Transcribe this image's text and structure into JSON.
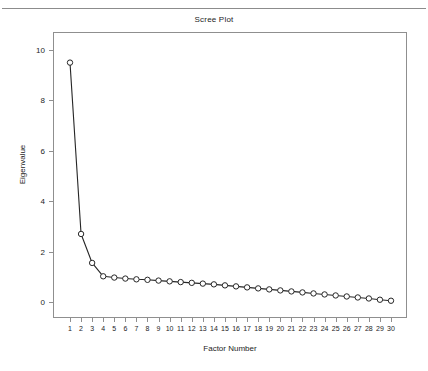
{
  "chart_data": {
    "type": "line",
    "title": "Scree Plot",
    "xlabel": "Factor Number",
    "ylabel": "Eigenvalue",
    "x": [
      1,
      2,
      3,
      4,
      5,
      6,
      7,
      8,
      9,
      10,
      11,
      12,
      13,
      14,
      15,
      16,
      17,
      18,
      19,
      20,
      21,
      22,
      23,
      24,
      25,
      26,
      27,
      28,
      29,
      30
    ],
    "values": [
      9.5,
      2.7,
      1.55,
      1.02,
      0.97,
      0.93,
      0.9,
      0.88,
      0.85,
      0.82,
      0.79,
      0.76,
      0.73,
      0.7,
      0.66,
      0.62,
      0.58,
      0.54,
      0.5,
      0.46,
      0.42,
      0.38,
      0.34,
      0.3,
      0.26,
      0.22,
      0.18,
      0.14,
      0.09,
      0.05
    ],
    "series": [
      {
        "name": "Eigenvalue",
        "values": [
          9.5,
          2.7,
          1.55,
          1.02,
          0.97,
          0.93,
          0.9,
          0.88,
          0.85,
          0.82,
          0.79,
          0.76,
          0.73,
          0.7,
          0.66,
          0.62,
          0.58,
          0.54,
          0.5,
          0.46,
          0.42,
          0.38,
          0.34,
          0.3,
          0.26,
          0.22,
          0.18,
          0.14,
          0.09,
          0.05
        ]
      }
    ],
    "xlim": [
      0.5,
      30.5
    ],
    "ylim": [
      0,
      10.5
    ],
    "yticks": [
      0,
      2,
      4,
      6,
      8,
      10
    ],
    "ytick_labels": [
      "0",
      "2",
      "4",
      "6",
      "8",
      "10"
    ],
    "xticks": [
      1,
      2,
      3,
      4,
      5,
      6,
      7,
      8,
      9,
      10,
      11,
      12,
      13,
      14,
      15,
      16,
      17,
      18,
      19,
      20,
      21,
      22,
      23,
      24,
      25,
      26,
      27,
      28,
      29,
      30
    ],
    "xtick_labels": [
      "1",
      "2",
      "3",
      "4",
      "5",
      "6",
      "7",
      "8",
      "9",
      "10",
      "11",
      "12",
      "13",
      "14",
      "15",
      "16",
      "17",
      "18",
      "19",
      "20",
      "21",
      "22",
      "23",
      "24",
      "25",
      "26",
      "27",
      "28",
      "29",
      "30"
    ],
    "grid": false,
    "legend": "none",
    "marker": "open-circle",
    "line_color": "#262626",
    "marker_fill": "#ffffff",
    "marker_edge": "#262626",
    "frame_color": "#8f8f8f"
  }
}
